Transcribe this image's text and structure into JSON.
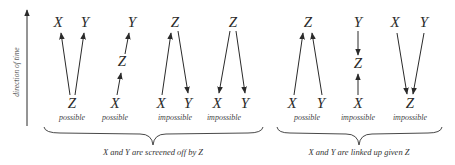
{
  "axis": {
    "label": "direction of time"
  },
  "groups": [
    {
      "caption": "X and Y are screened off by Z",
      "diagrams": [
        {
          "top": [
            "X",
            "Y"
          ],
          "middle": "",
          "bottom": [
            "Z"
          ],
          "label": "possible",
          "structure": "common cause: Z → X, Z → Y"
        },
        {
          "top": [
            "Y"
          ],
          "middle": "Z",
          "bottom": [
            "X"
          ],
          "label": "possible",
          "structure": "chain: X → Z → Y"
        },
        {
          "top": [
            "Z"
          ],
          "middle": "",
          "bottom": [
            "X",
            "Y"
          ],
          "label": "impossible",
          "structure": "X → Z → Y"
        },
        {
          "top": [
            "Z"
          ],
          "middle": "",
          "bottom": [
            "X",
            "Y"
          ],
          "label": "impossible",
          "structure": "Z → X, Z → Y (backward)"
        }
      ]
    },
    {
      "caption": "X and Y are linked up given Z",
      "diagrams": [
        {
          "top": [
            "Z"
          ],
          "middle": "",
          "bottom": [
            "X",
            "Y"
          ],
          "label": "possible",
          "structure": "common effect: X → Z, Y → Z"
        },
        {
          "top": [
            "Y"
          ],
          "middle": "Z",
          "bottom": [
            "X"
          ],
          "label": "impossible",
          "structure": "X → Z ← Y"
        },
        {
          "top": [
            "X",
            "Y"
          ],
          "middle": "",
          "bottom": [
            "Z"
          ],
          "label": "impossible",
          "structure": "X → Z, Y → Z (backward)"
        }
      ]
    }
  ],
  "text": {
    "d1": {
      "x": "X",
      "y": "Y",
      "z": "Z",
      "label": "possible"
    },
    "d2": {
      "x": "X",
      "y": "Y",
      "z": "Z",
      "label": "possible"
    },
    "d3": {
      "x": "X",
      "y": "Y",
      "z": "Z",
      "label": "impossible"
    },
    "d4": {
      "x": "X",
      "y": "Y",
      "z": "Z",
      "label": "impossible"
    },
    "d5": {
      "x": "X",
      "y": "Y",
      "z": "Z",
      "label": "possible"
    },
    "d6": {
      "x": "X",
      "y": "Y",
      "z": "Z",
      "label": "impossible"
    },
    "d7": {
      "x": "X",
      "y": "Y",
      "z": "Z",
      "label": "impossible"
    },
    "caption1": "X and Y are screened off by Z",
    "caption2": "X and Y are linked up given Z"
  }
}
